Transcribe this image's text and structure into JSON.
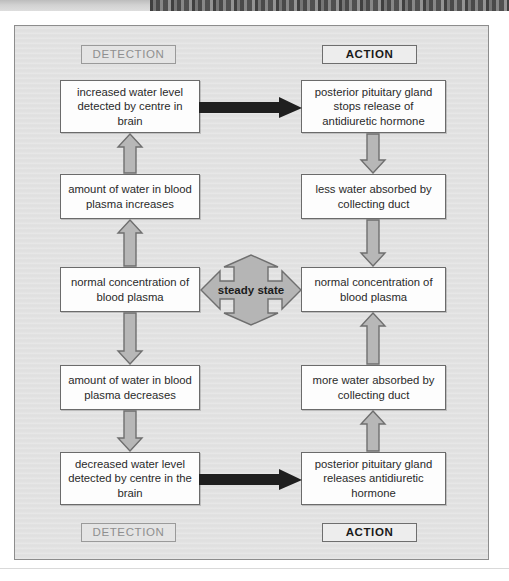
{
  "diagram": {
    "colors": {
      "panel_bg": "#e2e2e2",
      "box_bg": "#fdfdfd",
      "box_border": "#6b6b6b",
      "gray_arrow_fill": "#b7b7b7",
      "gray_arrow_stroke": "#6f6f6f",
      "black_arrow": "#1a1a1a",
      "steady_fill": "#b5b5b5",
      "detection_label_color": "#8f8f8f",
      "action_label_color": "#1a1a1a"
    },
    "headers": {
      "top_left": "DETECTION",
      "top_right": "ACTION",
      "bottom_left": "DETECTION",
      "bottom_right": "ACTION"
    },
    "center": {
      "label": "steady state",
      "icon": "four-way-arrow-icon"
    },
    "left_column": [
      {
        "id": "l1",
        "text": "increased water level detected by centre in brain"
      },
      {
        "id": "l2",
        "text": "amount of water in blood plasma increases"
      },
      {
        "id": "l3",
        "text": "normal concentration of blood plasma"
      },
      {
        "id": "l4",
        "text": "amount of water in blood plasma decreases"
      },
      {
        "id": "l5",
        "text": "decreased water level detected by centre in the brain"
      }
    ],
    "right_column": [
      {
        "id": "r1",
        "text": "posterior pituitary gland stops release of antidiuretic hormone"
      },
      {
        "id": "r2",
        "text": "less water absorbed by collecting duct"
      },
      {
        "id": "r3",
        "text": "normal concentration of blood plasma"
      },
      {
        "id": "r4",
        "text": "more water absorbed by collecting duct"
      },
      {
        "id": "r5",
        "text": "posterior pituitary gland releases antidiuretic hormone"
      }
    ],
    "arrows": {
      "left_up_1": "arrow-up-icon",
      "left_up_2": "arrow-up-icon",
      "left_down_1": "arrow-down-icon",
      "left_down_2": "arrow-down-icon",
      "right_down_1": "arrow-down-icon",
      "right_down_2": "arrow-down-icon",
      "right_up_1": "arrow-up-icon",
      "right_up_2": "arrow-up-icon",
      "top_black": "arrow-right-icon",
      "bottom_black": "arrow-right-icon"
    }
  }
}
